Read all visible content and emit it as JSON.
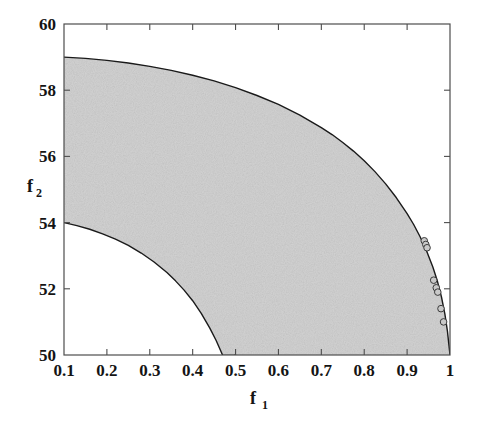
{
  "figure": {
    "background_color": "#ffffff",
    "plot_box": {
      "left": 64,
      "top": 24,
      "right": 450,
      "bottom": 355
    },
    "axis_line_color": "#4d4d4d",
    "curve_color": "#1a1a1a",
    "fill_color": "#d2d2d2",
    "marker_face_color": "#c9c9c9",
    "marker_edge_color": "#3a3a3a"
  },
  "chart_data": {
    "type": "area",
    "title": "",
    "subtitle": "",
    "xlabel": "f_1",
    "xlabel_text": "f",
    "xlabel_sub": "1",
    "ylabel": "f_2",
    "ylabel_text": "f",
    "ylabel_sub": "2",
    "xlim": [
      0.1,
      1.0
    ],
    "ylim": [
      50,
      60
    ],
    "grid": false,
    "legend": null,
    "legend_position": "none",
    "x_ticks": [
      0.1,
      0.2,
      0.3,
      0.4,
      0.5,
      0.6,
      0.7,
      0.8,
      0.9,
      1.0
    ],
    "x_tick_labels": [
      "0.1",
      "0.2",
      "0.3",
      "0.4",
      "0.5",
      "0.6",
      "0.7",
      "0.8",
      "0.9",
      "1"
    ],
    "y_ticks": [
      50,
      52,
      54,
      56,
      58,
      60
    ],
    "y_tick_labels": [
      "50",
      "52",
      "54",
      "56",
      "58",
      "60"
    ],
    "tick_direction": "in",
    "box": true,
    "series": [
      {
        "name": "upper-boundary",
        "kind": "line",
        "x": [
          0.1,
          0.15,
          0.2,
          0.25,
          0.3,
          0.35,
          0.4,
          0.45,
          0.5,
          0.55,
          0.6,
          0.65,
          0.7,
          0.725,
          0.75,
          0.775,
          0.8,
          0.825,
          0.85,
          0.875,
          0.9,
          0.915,
          0.93,
          0.945,
          0.96,
          0.97,
          0.98,
          0.988,
          0.994,
          1.0
        ],
        "y": [
          59.0,
          58.96,
          58.9,
          58.82,
          58.72,
          58.6,
          58.45,
          58.28,
          58.08,
          57.84,
          57.57,
          57.25,
          56.87,
          56.66,
          56.42,
          56.16,
          55.87,
          55.54,
          55.17,
          54.75,
          54.27,
          53.95,
          53.58,
          53.16,
          52.66,
          52.26,
          51.76,
          51.24,
          50.72,
          50.0
        ]
      },
      {
        "name": "lower-boundary",
        "kind": "line",
        "x": [
          0.1,
          0.13,
          0.16,
          0.19,
          0.22,
          0.25,
          0.28,
          0.31,
          0.34,
          0.36,
          0.38,
          0.4,
          0.42,
          0.44,
          0.455,
          0.47,
          0.48,
          0.49,
          0.496,
          0.5
        ],
        "y": [
          54.0,
          53.91,
          53.8,
          53.66,
          53.5,
          53.31,
          53.08,
          52.81,
          52.49,
          52.24,
          51.96,
          51.64,
          51.26,
          50.81,
          50.43,
          49.99,
          49.99,
          49.99,
          49.99,
          50.0
        ]
      },
      {
        "name": "pareto-points",
        "kind": "scatter",
        "marker": "circle",
        "x": [
          0.94,
          0.9435,
          0.9465,
          0.962,
          0.968,
          0.9715,
          0.979,
          0.985
        ],
        "y": [
          53.45,
          53.34,
          53.24,
          52.26,
          52.03,
          51.9,
          51.4,
          51.0
        ]
      }
    ]
  }
}
